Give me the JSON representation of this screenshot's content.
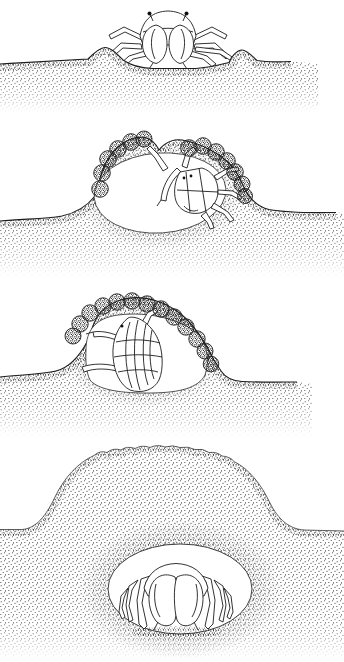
{
  "figure": {
    "name": "crab-burrow-construction-sequence",
    "colors": {
      "ink": "#1c1c1c",
      "paper": "#ffffff"
    },
    "panels": [
      {
        "label": "Stage 1: crab resting in a shallow scrape on the sand surface between two excavated mounds"
      },
      {
        "label": "Stage 2: crab tilted inside pit, building an arch of sand pellets over itself, roof gap still open"
      },
      {
        "label": "Stage 3: pellet arch complete, crab enclosed inside the domed chamber"
      },
      {
        "label": "Stage 4: smooth sealed sand dome with the crab crouched inside the buried chamber"
      }
    ]
  }
}
